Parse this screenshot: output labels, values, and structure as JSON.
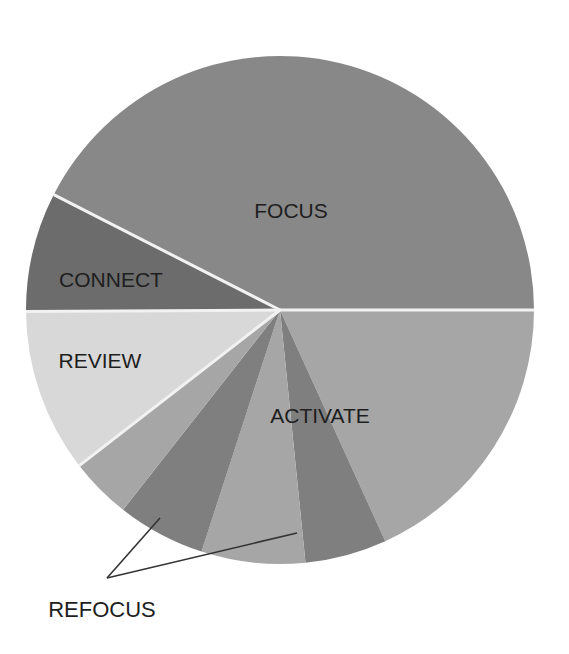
{
  "chart_data": {
    "type": "pie",
    "title": "",
    "center": [
      280,
      310
    ],
    "radius": 254,
    "start_angle_deg": 0,
    "direction": "clockwise-from-right-in-screen-space",
    "slices": [
      {
        "name": "ACTIVATE",
        "label": "",
        "percent": 18.2,
        "color": "#a6a6a6"
      },
      {
        "name": "REFOCUS",
        "label": "",
        "percent": 5.2,
        "color": "#7f7f7f"
      },
      {
        "name": "ACTIVATE",
        "label": "",
        "percent": 6.6,
        "color": "#a6a6a6"
      },
      {
        "name": "REFOCUS",
        "label": "",
        "percent": 5.6,
        "color": "#7f7f7f"
      },
      {
        "name": "ACTIVATE",
        "label": "",
        "percent": 3.9,
        "color": "#a6a6a6"
      },
      {
        "name": "REVIEW",
        "label": "",
        "percent": 10.4,
        "color": "#d8d8d8"
      },
      {
        "name": "CONNECT",
        "label": "",
        "percent": 7.6,
        "color": "#6c6c6c"
      },
      {
        "name": "FOCUS",
        "label": "",
        "percent": 42.5,
        "color": "#888888"
      }
    ],
    "totals": {
      "FOCUS": 42.5,
      "ACTIVATE": 28.7,
      "REFOCUS": 10.8,
      "REVIEW": 10.4,
      "CONNECT": 7.6
    },
    "separators": [
      "FOCUS|CONNECT",
      "CONNECT|REVIEW",
      "REVIEW|ACTIVATE",
      "FOCUS|ACTIVATE"
    ],
    "legend": "none",
    "labels": [
      {
        "text": "FOCUS",
        "x": 291,
        "y": 218
      },
      {
        "text": "CONNECT",
        "x": 111,
        "y": 287
      },
      {
        "text": "REVIEW",
        "x": 100,
        "y": 368
      },
      {
        "text": "ACTIVATE",
        "x": 320,
        "y": 423
      },
      {
        "text": "REFOCUS",
        "x": 102,
        "y": 617
      }
    ],
    "annotations": [
      {
        "text": "REFOCUS",
        "leader_from": [
          107,
          578
        ],
        "leader_to": [
          [
            160,
            518
          ],
          [
            297,
            533
          ]
        ]
      }
    ]
  }
}
